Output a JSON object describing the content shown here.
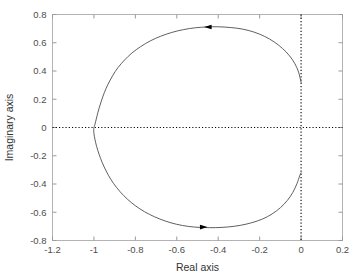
{
  "figure": {
    "kind": "nyquist-plot",
    "background_color": "#ffffff",
    "frame_color": "#b3b3b3",
    "curve_color": "#4d4d4d",
    "reference_line_color": "#000000"
  },
  "labels": {
    "xlabel": "Real axis",
    "ylabel": "Imaginary axis"
  },
  "chart_data": {
    "type": "line",
    "title": "",
    "subtitle": "",
    "xlabel": "Real axis",
    "ylabel": "Imaginary axis",
    "xlim": [
      -1.2,
      0.2
    ],
    "ylim": [
      -0.8,
      0.8
    ],
    "xticks": [
      -1.2,
      -1,
      -0.8,
      -0.6,
      -0.4,
      -0.2,
      0,
      0.2
    ],
    "xticklabels": [
      "-1.2",
      "-1",
      "-0.8",
      "-0.6",
      "-0.4",
      "-0.2",
      "0",
      "0.2"
    ],
    "yticks": [
      -0.8,
      -0.6,
      -0.4,
      -0.2,
      0,
      0.2,
      0.4,
      0.6,
      0.8
    ],
    "yticklabels": [
      "-0.8",
      "-0.6",
      "-0.4",
      "-0.2",
      "0",
      "0.2",
      "0.4",
      "0.6",
      "0.8"
    ],
    "grid": false,
    "legend": null,
    "legend_position": "none",
    "reference_lines": [
      {
        "name": "real-axis-zero",
        "orientation": "horizontal",
        "value": 0,
        "style": "dotted"
      },
      {
        "name": "imag-axis-zero",
        "orientation": "vertical",
        "value": 0,
        "style": "dotted"
      }
    ],
    "annotations": [
      {
        "name": "direction-arrow-upper",
        "x": -0.45,
        "y": 0.712,
        "direction": "left"
      },
      {
        "name": "direction-arrow-lower",
        "x": -0.47,
        "y": -0.705,
        "direction": "right"
      }
    ],
    "series": [
      {
        "name": "nyquist-contour",
        "closed_loop": false,
        "points": [
          [
            0.0,
            0.32
          ],
          [
            -0.012,
            0.392
          ],
          [
            -0.03,
            0.452
          ],
          [
            -0.056,
            0.508
          ],
          [
            -0.09,
            0.56
          ],
          [
            -0.13,
            0.606
          ],
          [
            -0.176,
            0.645
          ],
          [
            -0.228,
            0.676
          ],
          [
            -0.284,
            0.697
          ],
          [
            -0.342,
            0.708
          ],
          [
            -0.4,
            0.713
          ],
          [
            -0.452,
            0.712
          ],
          [
            -0.51,
            0.706
          ],
          [
            -0.568,
            0.693
          ],
          [
            -0.624,
            0.673
          ],
          [
            -0.678,
            0.646
          ],
          [
            -0.728,
            0.613
          ],
          [
            -0.774,
            0.573
          ],
          [
            -0.816,
            0.528
          ],
          [
            -0.852,
            0.478
          ],
          [
            -0.884,
            0.424
          ],
          [
            -0.91,
            0.366
          ],
          [
            -0.932,
            0.306
          ],
          [
            -0.95,
            0.246
          ],
          [
            -0.964,
            0.188
          ],
          [
            -0.976,
            0.132
          ],
          [
            -0.985,
            0.082
          ],
          [
            -0.992,
            0.04
          ],
          [
            -0.997,
            0.012
          ],
          [
            -1.0,
            0.0
          ],
          [
            -1.001,
            -0.014
          ],
          [
            -1.0,
            -0.042
          ],
          [
            -0.995,
            -0.084
          ],
          [
            -0.987,
            -0.134
          ],
          [
            -0.975,
            -0.19
          ],
          [
            -0.96,
            -0.248
          ],
          [
            -0.941,
            -0.308
          ],
          [
            -0.918,
            -0.368
          ],
          [
            -0.89,
            -0.426
          ],
          [
            -0.857,
            -0.481
          ],
          [
            -0.82,
            -0.531
          ],
          [
            -0.778,
            -0.576
          ],
          [
            -0.732,
            -0.615
          ],
          [
            -0.682,
            -0.648
          ],
          [
            -0.628,
            -0.675
          ],
          [
            -0.572,
            -0.694
          ],
          [
            -0.514,
            -0.705
          ],
          [
            -0.47,
            -0.708
          ],
          [
            -0.412,
            -0.709
          ],
          [
            -0.352,
            -0.704
          ],
          [
            -0.294,
            -0.693
          ],
          [
            -0.238,
            -0.674
          ],
          [
            -0.186,
            -0.648
          ],
          [
            -0.14,
            -0.612
          ],
          [
            -0.1,
            -0.568
          ],
          [
            -0.066,
            -0.516
          ],
          [
            -0.04,
            -0.46
          ],
          [
            -0.02,
            -0.398
          ],
          [
            -0.007,
            -0.344
          ],
          [
            0.0,
            -0.32
          ]
        ]
      }
    ]
  }
}
